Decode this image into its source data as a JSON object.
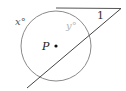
{
  "diagram": {
    "type": "circle-tangent-secant",
    "circle": {
      "center_label": "P",
      "cx": 56,
      "cy": 46,
      "r": 35
    },
    "labels": {
      "arc_far": "x°",
      "arc_near": "y°",
      "angle": "1",
      "center": "P"
    },
    "colors": {
      "circle": "#8a8a8a",
      "lines": "#555555",
      "arc_near_label": "#b5b5b5",
      "text": "#333333"
    }
  }
}
